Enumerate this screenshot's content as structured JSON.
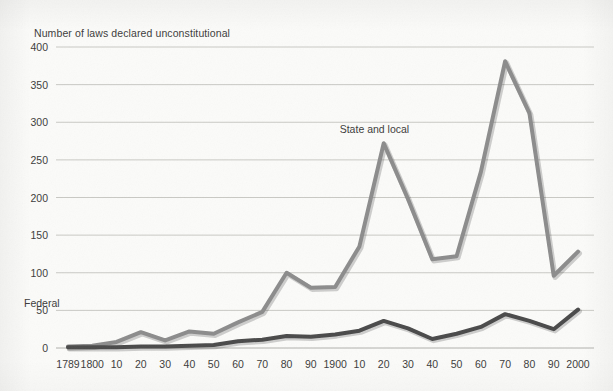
{
  "chart_data": {
    "type": "line",
    "title": "Number of laws declared unconstitutional",
    "xlabel": "",
    "ylabel": "",
    "ylim": [
      0,
      400
    ],
    "yticks": [
      0,
      50,
      100,
      150,
      200,
      250,
      300,
      350,
      400
    ],
    "ytick_labels": [
      "0",
      "50",
      "100",
      "150",
      "200",
      "250",
      "300",
      "350",
      "400"
    ],
    "grid": "horizontal",
    "legend": "inline-annotations",
    "categories": [
      "1789",
      "1800",
      "10",
      "20",
      "30",
      "40",
      "50",
      "60",
      "70",
      "80",
      "90",
      "1900",
      "10",
      "20",
      "30",
      "40",
      "50",
      "60",
      "70",
      "80",
      "90",
      "2000"
    ],
    "x": [
      1789,
      1800,
      1810,
      1820,
      1830,
      1840,
      1850,
      1860,
      1870,
      1880,
      1890,
      1900,
      1910,
      1920,
      1930,
      1940,
      1950,
      1960,
      1970,
      1980,
      1990,
      2000
    ],
    "series": [
      {
        "name": "State and local",
        "color": "#8c8c8c",
        "values": [
          2,
          3,
          8,
          21,
          10,
          22,
          19,
          34,
          48,
          100,
          80,
          81,
          135,
          272,
          198,
          118,
          122,
          234,
          381,
          312,
          96,
          128
        ]
      },
      {
        "name": "Federal",
        "color": "#4a4a4a",
        "values": [
          1,
          1,
          1,
          2,
          2,
          3,
          4,
          9,
          11,
          16,
          15,
          18,
          23,
          36,
          26,
          12,
          19,
          28,
          45,
          36,
          25,
          51
        ]
      }
    ],
    "annotations": [
      {
        "text": "State and local",
        "x": 1920,
        "y": 290
      },
      {
        "text": "Federal",
        "x": 1917,
        "y": 58
      }
    ]
  }
}
